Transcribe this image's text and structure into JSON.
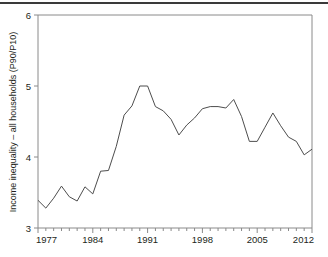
{
  "figure": {
    "top_rule": true,
    "line_color": "#4d4d4d",
    "frame_color": "#8a8a8a",
    "text_color": "#231f20"
  },
  "chart_data": {
    "type": "line",
    "title": "",
    "xlabel": "",
    "ylabel": "Income inequality – all households (P90/P10)",
    "xlim": [
      1977,
      2012
    ],
    "ylim": [
      3,
      6
    ],
    "yticks": [
      3,
      4,
      5,
      6
    ],
    "ytick_labels": [
      "3",
      "4",
      "5",
      "6"
    ],
    "xticks": [
      1977,
      1984,
      1991,
      1998,
      2005,
      2012
    ],
    "xtick_labels": [
      "1977",
      "1984",
      "1991",
      "1998",
      "2005",
      "2012"
    ],
    "minor_xtick_interval": 1,
    "grid": false,
    "legend": "none",
    "x": [
      1977,
      1978,
      1979,
      1980,
      1981,
      1982,
      1983,
      1984,
      1985,
      1986,
      1987,
      1988,
      1989,
      1990,
      1991,
      1992,
      1993,
      1994,
      1995,
      1996,
      1997,
      1998,
      1999,
      2000,
      2001,
      2002,
      2003,
      2004,
      2005,
      2006,
      2007,
      2008,
      2009,
      2010,
      2011,
      2012
    ],
    "values": [
      3.39,
      3.28,
      3.42,
      3.59,
      3.44,
      3.38,
      3.58,
      3.48,
      3.8,
      3.81,
      4.15,
      4.59,
      4.72,
      5.0,
      5.0,
      4.71,
      4.65,
      4.53,
      4.31,
      4.45,
      4.55,
      4.68,
      4.71,
      4.71,
      4.69,
      4.81,
      4.57,
      4.22,
      4.22,
      4.42,
      4.62,
      4.44,
      4.28,
      4.22,
      4.03,
      4.11
    ],
    "series": [
      {
        "name": "Income inequality (P90/P10), all households",
        "values": [
          3.39,
          3.28,
          3.42,
          3.59,
          3.44,
          3.38,
          3.58,
          3.48,
          3.8,
          3.81,
          4.15,
          4.59,
          4.72,
          5.0,
          5.0,
          4.71,
          4.65,
          4.53,
          4.31,
          4.45,
          4.55,
          4.68,
          4.71,
          4.71,
          4.69,
          4.81,
          4.57,
          4.22,
          4.22,
          4.42,
          4.62,
          4.44,
          4.28,
          4.22,
          4.03,
          4.11
        ]
      }
    ]
  }
}
